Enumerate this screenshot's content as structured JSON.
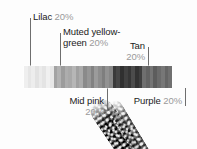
{
  "figure": {
    "kind": "color-proportion-bar",
    "background_motif": "textured beaded strands"
  },
  "chart_data": {
    "type": "bar",
    "orientation": "horizontal-stacked",
    "title": "",
    "xlabel": "",
    "ylabel": "",
    "categories": [
      "Lilac",
      "Muted yellow-green",
      "Mid pink",
      "Tan",
      "Purple"
    ],
    "values": [
      20,
      20,
      20,
      20,
      20
    ],
    "unit": "%",
    "value_labels": [
      "20%",
      "20%",
      "20%",
      "20%",
      "20%"
    ],
    "ylim": [
      0,
      100
    ],
    "grid": false,
    "legend": "callout-labels-with-leader-lines",
    "segment_fills": [
      "#e8e8e8",
      "#a7a7a7",
      "#8e8e8e",
      "#3c3c3c",
      "#6b6b6b"
    ],
    "segment_stripe_shades": [
      [
        "#efefef",
        "#e6e6e6",
        "#ededed",
        "#e2e2e2",
        "#ebebeb",
        "#e4e4e4",
        "#f0f0f0",
        "#e7e7e7"
      ],
      [
        "#a3a3a3",
        "#b2b2b2",
        "#9c9c9c",
        "#adadad",
        "#a8a8a8",
        "#b6b6b6",
        "#a0a0a0",
        "#aaaaaa"
      ],
      [
        "#8a8a8a",
        "#969696",
        "#828282",
        "#9b9b9b",
        "#8d8d8d",
        "#7e7e7e",
        "#929292",
        "#878787"
      ],
      [
        "#3a3a3a",
        "#474747",
        "#303030",
        "#414141",
        "#363636",
        "#4c4c4c",
        "#333333",
        "#3f3f3f"
      ],
      [
        "#6f6f6f",
        "#636363",
        "#757575",
        "#5d5d5d",
        "#6b6b6b",
        "#777777",
        "#656565",
        "#707070"
      ]
    ]
  },
  "callouts": [
    {
      "id": "lilac",
      "name": "Lilac",
      "pct": "20%",
      "line2": ""
    },
    {
      "id": "yellow-green",
      "name": "Muted yellow-",
      "pct": "20%",
      "line2": "green"
    },
    {
      "id": "mid-pink",
      "name": "Mid pink",
      "pct": "20%",
      "line2": ""
    },
    {
      "id": "tan",
      "name": "Tan",
      "pct": "20%",
      "line2": ""
    },
    {
      "id": "purple",
      "name": "Purple",
      "pct": "20%",
      "line2": ""
    }
  ],
  "colors": {
    "text": "#1b1b1b",
    "pct_text": "#9a9a9a",
    "leader_line": "#6e6e6e",
    "page_background": "#ffffff"
  }
}
